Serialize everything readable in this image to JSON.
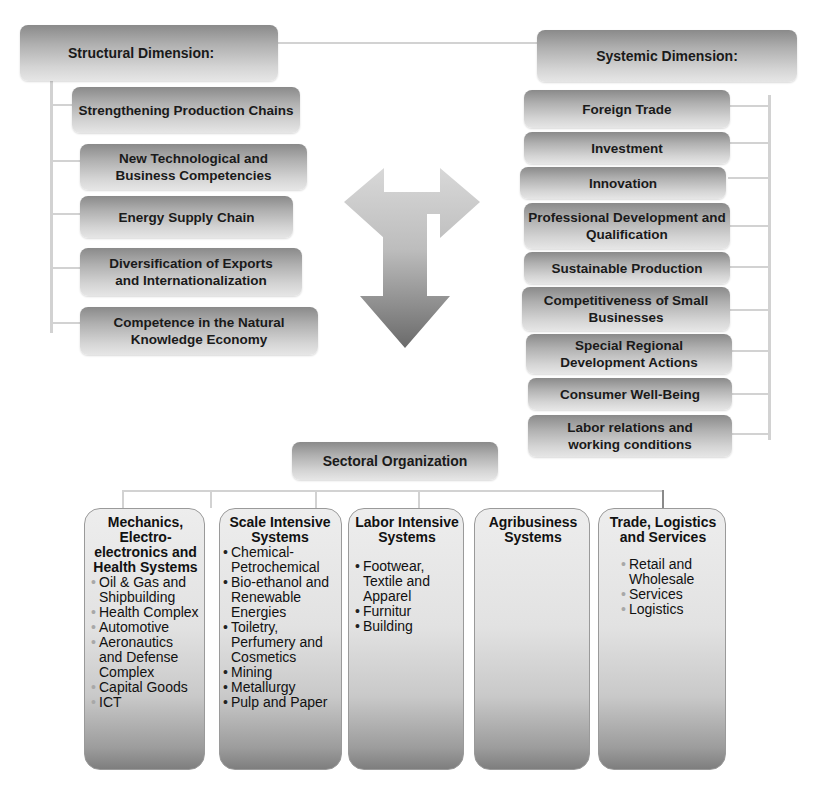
{
  "structural": {
    "title": "Structural Dimension:",
    "items": [
      {
        "label": "Strengthening Production Chains"
      },
      {
        "label": "New Technological and Business Competencies"
      },
      {
        "label": "Energy Supply Chain"
      },
      {
        "label": "Diversification of Exports and Internationalization"
      },
      {
        "label": "Competence in the Natural Knowledge Economy"
      }
    ]
  },
  "systemic": {
    "title": "Systemic Dimension:",
    "items": [
      {
        "label": "Foreign Trade"
      },
      {
        "label": "Investment"
      },
      {
        "label": "Innovation"
      },
      {
        "label": "Professional Development and Qualification"
      },
      {
        "label": "Sustainable Production"
      },
      {
        "label": "Competitiveness of Small Businesses"
      },
      {
        "label": "Special Regional Development Actions"
      },
      {
        "label": "Consumer Well-Being"
      },
      {
        "label": "Labor relations and working conditions"
      }
    ]
  },
  "center_arrow": {
    "icon": "t-shaped-three-way-arrow-icon"
  },
  "sectoral": {
    "title": "Sectoral Organization",
    "sectors": [
      {
        "title": "Mechanics, Electro-electronics and Health Systems",
        "items": [
          "Oil & Gas and Shipbuilding",
          "Health Complex",
          "Automotive",
          "Aeronautics and Defense Complex",
          "Capital Goods",
          "ICT"
        ]
      },
      {
        "title": "Scale Intensive Systems",
        "items": [
          "Chemical-Petrochemical",
          "Bio-ethanol and Renewable Energies",
          "Toiletry, Perfumery and Cosmetics",
          "Mining",
          "Metallurgy",
          "Pulp and Paper"
        ]
      },
      {
        "title": "Labor Intensive Systems",
        "items": [
          "Footwear, Textile and Apparel",
          "Furnitur",
          "Building"
        ]
      },
      {
        "title": "Agribusiness Systems",
        "items": []
      },
      {
        "title": "Trade, Logistics and Services",
        "items": [
          "Retail and Wholesale",
          "Services",
          "Logistics"
        ]
      }
    ]
  }
}
